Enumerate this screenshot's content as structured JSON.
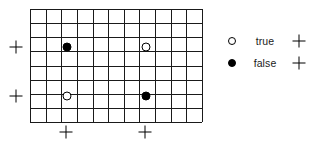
{
  "figure": {
    "title": "",
    "type": "grid-scatter-diagram"
  },
  "grid": {
    "columns": 11,
    "rows": 8,
    "line_color": "#1a1a1a",
    "background_color": "#ffffff",
    "bounds_px": {
      "left": 30,
      "top": 9,
      "width": 172,
      "height": 113
    }
  },
  "markers": [
    {
      "name": "marker-false-upper-left",
      "state": "false",
      "style": "filled",
      "x": 67,
      "y": 47
    },
    {
      "name": "marker-true-upper-right",
      "state": "true",
      "style": "open",
      "x": 146,
      "y": 47
    },
    {
      "name": "marker-true-lower-left",
      "state": "true",
      "style": "open",
      "x": 67,
      "y": 96
    },
    {
      "name": "marker-false-lower-right",
      "state": "false",
      "style": "filled",
      "x": 146,
      "y": 96
    }
  ],
  "ticks": {
    "left": [
      {
        "name": "row-tick-upper",
        "x": 16,
        "y": 47
      },
      {
        "name": "row-tick-lower",
        "x": 16,
        "y": 96
      }
    ],
    "bottom": [
      {
        "name": "column-tick-left",
        "x": 66,
        "y": 132
      },
      {
        "name": "column-tick-right",
        "x": 145,
        "y": 132
      }
    ]
  },
  "legend": {
    "entries": [
      {
        "label": "true",
        "style": "open",
        "plus": "+"
      },
      {
        "label": "false",
        "style": "filled",
        "plus": "+"
      }
    ]
  },
  "colors": {
    "ink": "#000000",
    "grid": "#1a1a1a",
    "paper": "#ffffff"
  }
}
